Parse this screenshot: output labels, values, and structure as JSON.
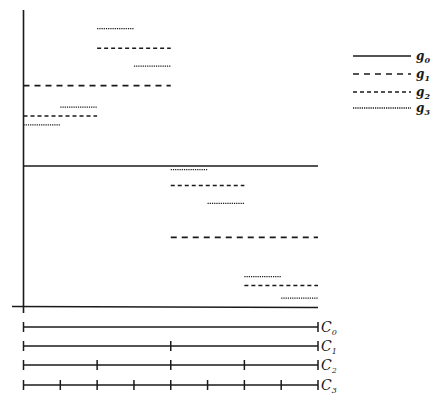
{
  "diagram": {
    "type": "multiresolution step functions",
    "legend": [
      {
        "key": "g0",
        "base": "g",
        "sub": "0",
        "style": "solid"
      },
      {
        "key": "g1",
        "base": "g",
        "sub": "1",
        "style": "long-dash"
      },
      {
        "key": "g2",
        "base": "g",
        "sub": "2",
        "style": "short-dash"
      },
      {
        "key": "g3",
        "base": "g",
        "sub": "3",
        "style": "dotted"
      }
    ],
    "partitions": [
      {
        "label": "C",
        "sub": "0",
        "divisions": 1
      },
      {
        "label": "C",
        "sub": "1",
        "divisions": 2
      },
      {
        "label": "C",
        "sub": "2",
        "divisions": 4
      },
      {
        "label": "C",
        "sub": "3",
        "divisions": 8
      }
    ],
    "segments": [
      {
        "fn": "g0",
        "x0": 0,
        "x1": 8,
        "level": 0.79
      },
      {
        "fn": "g1",
        "x0": 0,
        "x1": 4,
        "level": 1.24
      },
      {
        "fn": "g1",
        "x0": 4,
        "x1": 8,
        "level": 0.39
      },
      {
        "fn": "g2",
        "x0": 0,
        "x1": 2,
        "level": 1.07
      },
      {
        "fn": "g2",
        "x0": 2,
        "x1": 4,
        "level": 1.45
      },
      {
        "fn": "g2",
        "x0": 4,
        "x1": 6,
        "level": 0.68
      },
      {
        "fn": "g2",
        "x0": 6,
        "x1": 8,
        "level": 0.12
      },
      {
        "fn": "g3",
        "x0": 0,
        "x1": 1,
        "level": 1.02
      },
      {
        "fn": "g3",
        "x0": 1,
        "x1": 2,
        "level": 1.12
      },
      {
        "fn": "g3",
        "x0": 2,
        "x1": 3,
        "level": 1.56
      },
      {
        "fn": "g3",
        "x0": 3,
        "x1": 4,
        "level": 1.35
      },
      {
        "fn": "g3",
        "x0": 4,
        "x1": 5,
        "level": 0.77
      },
      {
        "fn": "g3",
        "x0": 5,
        "x1": 6,
        "level": 0.58
      },
      {
        "fn": "g3",
        "x0": 6,
        "x1": 7,
        "level": 0.17
      },
      {
        "fn": "g3",
        "x0": 7,
        "x1": 8,
        "level": 0.05
      }
    ]
  }
}
